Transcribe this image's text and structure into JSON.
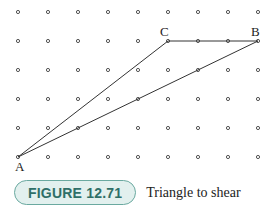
{
  "figure": {
    "grid": {
      "columns": 9,
      "rows": 6,
      "x0": 18,
      "y0": 12,
      "dx": 30,
      "dy": 29,
      "dot_color": "#555555"
    },
    "triangle": {
      "vertices": [
        {
          "label": "A",
          "col": 0,
          "row": 5
        },
        {
          "label": "B",
          "col": 8,
          "row": 1
        },
        {
          "label": "C",
          "col": 5,
          "row": 1
        }
      ],
      "line_color": "#333333"
    }
  },
  "caption": {
    "badge": "FIGURE 12.71",
    "text": "Triangle to shear"
  }
}
